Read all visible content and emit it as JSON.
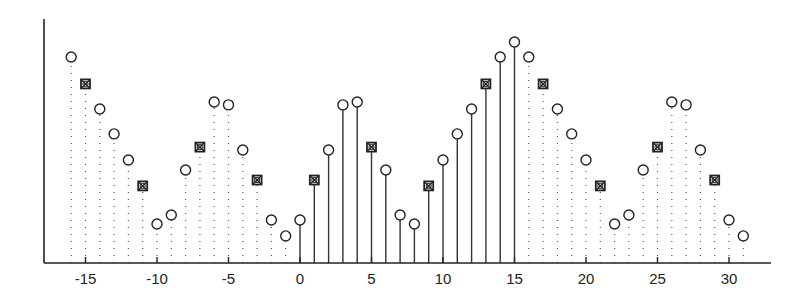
{
  "chart_data": {
    "type": "stem",
    "title": "",
    "xlabel": "",
    "ylabel": "",
    "xlim": [
      -18,
      33
    ],
    "ylim": [
      0,
      1.0
    ],
    "grid": false,
    "legend": null,
    "x_ticks": [
      -15,
      -10,
      -5,
      0,
      5,
      10,
      15,
      20,
      25,
      30
    ],
    "x_tick_labels": [
      "-15",
      "-10",
      "-5",
      "0",
      "5",
      "10",
      "15",
      "20",
      "25",
      "30"
    ],
    "x": [
      -16,
      -15,
      -14,
      -13,
      -12,
      -11,
      -10,
      -9,
      -8,
      -7,
      -6,
      -5,
      -4,
      -3,
      -2,
      -1,
      0,
      1,
      2,
      3,
      4,
      5,
      6,
      7,
      8,
      9,
      10,
      11,
      12,
      13,
      14,
      15,
      16,
      17,
      18,
      19,
      20,
      21,
      22,
      23,
      24,
      25,
      26,
      27,
      28,
      29,
      30,
      31
    ],
    "values": [
      0.844,
      0.734,
      0.631,
      0.529,
      0.422,
      0.316,
      0.16,
      0.197,
      0.381,
      0.475,
      0.66,
      0.648,
      0.463,
      0.34,
      0.176,
      0.111,
      0.176,
      0.34,
      0.463,
      0.648,
      0.66,
      0.475,
      0.381,
      0.197,
      0.16,
      0.316,
      0.422,
      0.529,
      0.631,
      0.734,
      0.844,
      0.906,
      0.844,
      0.734,
      0.631,
      0.529,
      0.422,
      0.316,
      0.16,
      0.197,
      0.381,
      0.475,
      0.66,
      0.648,
      0.463,
      0.34,
      0.176,
      0.111
    ],
    "solid_stem_range": [
      0,
      15
    ],
    "stem_style_outside_range": "dotted",
    "marker_default": "circle",
    "marker_special": "boxed-x",
    "marker_special_x": [
      -15,
      -11,
      -7,
      -3,
      1,
      5,
      9,
      13,
      17,
      21,
      25,
      29
    ],
    "colors": {
      "axis": "#222222",
      "stem": "#333333",
      "marker": "#222222",
      "background": "#ffffff"
    }
  }
}
